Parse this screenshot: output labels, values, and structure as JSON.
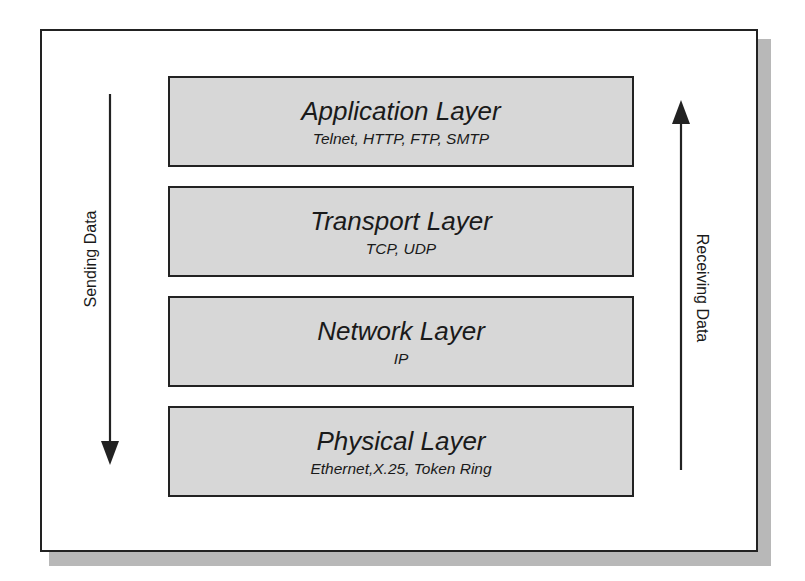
{
  "diagram": {
    "type": "network-layer-stack",
    "colors": {
      "layer_fill": "#d7d7d7",
      "border": "#222222",
      "shadow": "#b8b8b8",
      "background": "#ffffff"
    },
    "layers": [
      {
        "title": "Application Layer",
        "protocols": "Telnet, HTTP, FTP, SMTP"
      },
      {
        "title": "Transport Layer",
        "protocols": "TCP, UDP"
      },
      {
        "title": "Network Layer",
        "protocols": "IP"
      },
      {
        "title": "Physical Layer",
        "protocols": "Ethernet,X.25, Token Ring"
      }
    ],
    "left_arrow": {
      "label": "Sending Data",
      "direction": "down"
    },
    "right_arrow": {
      "label": "Receiving Data",
      "direction": "up"
    }
  }
}
